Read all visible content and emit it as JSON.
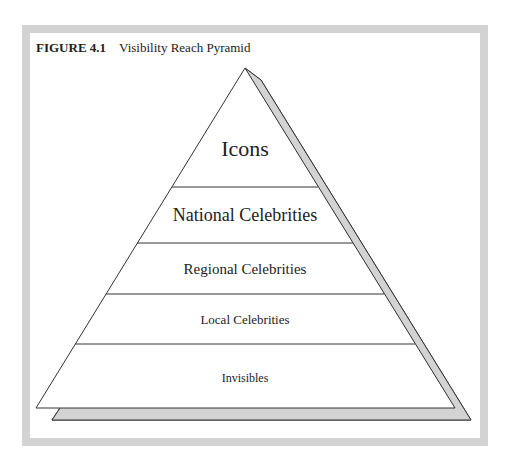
{
  "figure": {
    "number": "FIGURE 4.1",
    "title": "Visibility Reach Pyramid"
  },
  "pyramid": {
    "levels": [
      {
        "label": "Icons",
        "font_size": 22
      },
      {
        "label": "National Celebrities",
        "font_size": 18
      },
      {
        "label": "Regional Celebrities",
        "font_size": 15
      },
      {
        "label": "Local Celebrities",
        "font_size": 13
      },
      {
        "label": "Invisibles",
        "font_size": 12
      }
    ],
    "shadow_color": "#d3d3d3",
    "line_color": "#333333"
  }
}
